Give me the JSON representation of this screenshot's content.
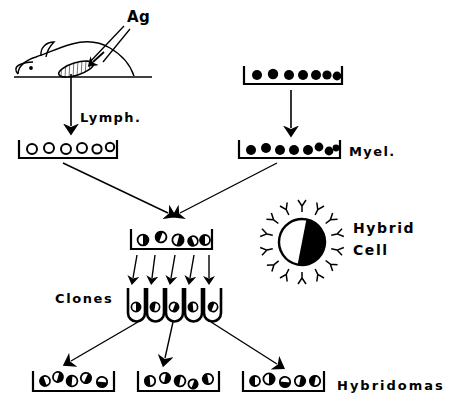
{
  "figure": {
    "ink_color": "#000000",
    "background_color": "#ffffff"
  },
  "labels": {
    "antigen": "Ag",
    "lymph": "Lymph.",
    "myeloma": "Myel.",
    "clones": "Clones",
    "hybrid_cell_line1": "Hybrid",
    "hybrid_cell_line2": "Cell",
    "hybridomas": "Hybridomas"
  },
  "mouse": {
    "name": "immunized-mouse",
    "has_ear": true,
    "has_eye": true,
    "organ": "spleen-lymph-node"
  },
  "dishes": [
    {
      "name": "lymphocyte-dish",
      "cell_style": "hollow",
      "cell_count": 6,
      "x": 18,
      "y": 140,
      "width": 100,
      "height": 20
    },
    {
      "name": "myeloma-dish-top",
      "cell_style": "filled",
      "cell_count": 7,
      "x": 243,
      "y": 66,
      "width": 100,
      "height": 20
    },
    {
      "name": "myeloma-dish-bottom",
      "cell_style": "filled",
      "cell_count": 8,
      "x": 238,
      "y": 140,
      "width": 102,
      "height": 20
    },
    {
      "name": "fusion-dish",
      "cell_style": "half",
      "cell_count": 5,
      "x": 130,
      "y": 229,
      "width": 82,
      "height": 20
    },
    {
      "name": "hybridoma-dish-left",
      "cell_style": "half",
      "cell_count": 5,
      "x": 32,
      "y": 371,
      "width": 82,
      "height": 20
    },
    {
      "name": "hybridoma-dish-center",
      "cell_style": "half",
      "cell_count": 5,
      "x": 137,
      "y": 371,
      "width": 82,
      "height": 20
    },
    {
      "name": "hybridoma-dish-right",
      "cell_style": "half",
      "cell_count": 5,
      "x": 242,
      "y": 371,
      "width": 82,
      "height": 20
    }
  ],
  "clone_tubes": {
    "name": "clone-culture-tubes",
    "count": 5,
    "cell_style": "half",
    "x": 128,
    "y": 288,
    "spacing": 19
  },
  "hybrid_cell": {
    "name": "hybrid-cell-illustration",
    "center_x": 302,
    "center_y": 242,
    "radius": 23,
    "left_half": "white",
    "right_half": "black",
    "antibody_count": 14,
    "antibody_shape": "Y"
  },
  "arrows": [
    {
      "name": "antigen-injection-arrow",
      "from": "Ag label",
      "to": "mouse spleen"
    },
    {
      "name": "lymph-extraction-arrow",
      "from": "mouse spleen",
      "to": "lymphocyte dish"
    },
    {
      "name": "myeloma-transfer-arrow",
      "from": "myeloma dish top",
      "to": "myeloma dish bottom"
    },
    {
      "name": "lymph-to-fusion-arrow",
      "from": "lymphocyte dish",
      "to": "fusion dish"
    },
    {
      "name": "myeloma-to-fusion-arrow",
      "from": "myeloma dish bottom",
      "to": "fusion dish"
    },
    {
      "name": "fusion-to-clone-arrow-1",
      "from": "fusion dish",
      "to": "clone tube 1"
    },
    {
      "name": "fusion-to-clone-arrow-2",
      "from": "fusion dish",
      "to": "clone tube 2"
    },
    {
      "name": "fusion-to-clone-arrow-3",
      "from": "fusion dish",
      "to": "clone tube 3"
    },
    {
      "name": "fusion-to-clone-arrow-4",
      "from": "fusion dish",
      "to": "clone tube 4"
    },
    {
      "name": "fusion-to-clone-arrow-5",
      "from": "fusion dish",
      "to": "clone tube 5"
    },
    {
      "name": "clone-to-hybridoma-arrow-left",
      "from": "clones",
      "to": "hybridoma dish left"
    },
    {
      "name": "clone-to-hybridoma-arrow-center",
      "from": "clones",
      "to": "hybridoma dish center"
    },
    {
      "name": "clone-to-hybridoma-arrow-right",
      "from": "clones",
      "to": "hybridoma dish right"
    }
  ]
}
